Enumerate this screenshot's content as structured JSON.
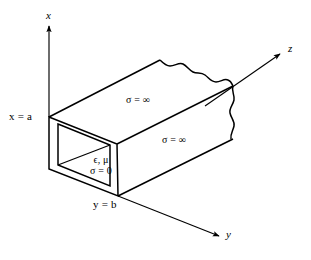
{
  "figure": {
    "type": "waveguide-cross-section-diagram",
    "background_color": "#ffffff",
    "line_color": "#000000"
  },
  "axes": {
    "x": {
      "label": "x",
      "direction": "up",
      "origin_px": [
        49,
        117
      ],
      "tip_px": [
        49,
        24
      ],
      "label_px": [
        46,
        10
      ]
    },
    "y": {
      "label": "y",
      "direction": "down-right",
      "origin_px": [
        118,
        196
      ],
      "tip_px": [
        222,
        237
      ],
      "label_px": [
        226,
        229
      ]
    },
    "z": {
      "label": "z",
      "direction": "up-right",
      "origin_px": [
        233,
        85
      ],
      "tip_px": [
        283,
        52
      ],
      "label_px": [
        288,
        43
      ]
    }
  },
  "dimension_labels": [
    {
      "name": "x-equals-a",
      "text": "x = a",
      "px": [
        9,
        112
      ]
    },
    {
      "name": "y-equals-b",
      "text": "y = b",
      "px": [
        93,
        200
      ]
    }
  ],
  "conductivity_labels": [
    {
      "name": "sigma-infinity-top-face",
      "text": "σ = ∞",
      "px": [
        126,
        96
      ],
      "face": "top"
    },
    {
      "name": "sigma-infinity-side-face",
      "text": "σ = ∞",
      "px": [
        162,
        136
      ],
      "face": "front-side"
    }
  ],
  "interior_medium": {
    "name": "interior-medium-properties",
    "line1": "ϵ, μ",
    "line2": "σ = 0",
    "px": [
      83,
      156
    ]
  },
  "geometry": {
    "outer_front_face": {
      "top_left": [
        49,
        117
      ],
      "top_right": [
        117,
        144
      ],
      "bottom_right": [
        118,
        196
      ],
      "bottom_left": [
        49,
        169
      ]
    },
    "inner_aperture": {
      "top_left": [
        58,
        124
      ],
      "top_right": [
        110,
        145
      ],
      "bottom_right": [
        110,
        186
      ],
      "bottom_left": [
        58,
        165
      ]
    },
    "top_face_back_left": [
      160,
      60
    ],
    "top_face_back_right": [
      233,
      85
    ],
    "side_face_back_bottom": [
      233,
      140
    ],
    "torn_edges": [
      "top-back-edge",
      "right-vertical-edge"
    ]
  }
}
